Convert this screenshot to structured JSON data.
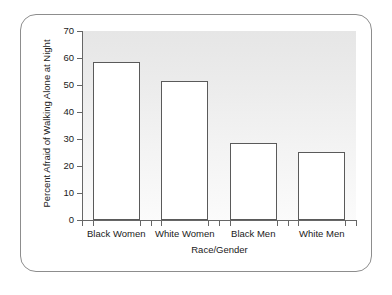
{
  "chart_data": {
    "type": "bar",
    "title": "",
    "categories": [
      "Black Women",
      "White Women",
      "Black Men",
      "White Men"
    ],
    "values": [
      58.7,
      51.3,
      28.7,
      25.2
    ],
    "xlabel": "Race/Gender",
    "ylabel": "Percent Afraid of Walking Alone at Night",
    "ylim": [
      0,
      70
    ],
    "yticks": [
      0,
      10,
      20,
      30,
      40,
      50,
      60,
      70
    ],
    "ytick_labels": [
      "0",
      "10",
      "20",
      "30",
      "40",
      "50",
      "60",
      "70"
    ],
    "grid": false,
    "legend": null,
    "bar_fill_color": "#ffffff",
    "bar_edge_color": "#5a5a5a",
    "plot_background_top": "#e6e6e6",
    "plot_background_bottom": "#fbfbfb",
    "frame_border_color": "#8d8d8d",
    "axis_color": "#666666",
    "text_color": "#1a1a1a"
  }
}
